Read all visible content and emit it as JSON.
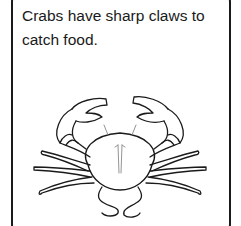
{
  "card": {
    "caption": "Crabs have sharp claws to catch food.",
    "illustration": "crab-line-drawing",
    "border_color": "#1a1a1a"
  }
}
